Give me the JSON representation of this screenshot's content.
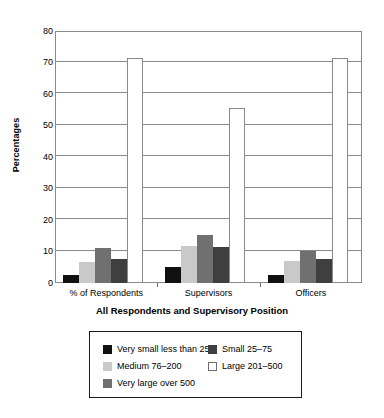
{
  "chart_data": {
    "type": "bar",
    "title": "",
    "xlabel": "All Respondents and Supervisory Position",
    "ylabel": "Percentages",
    "categories": [
      "% of Respondents",
      "Supervisors",
      "Officers"
    ],
    "ylim": [
      0,
      80
    ],
    "yticks": [
      0,
      10,
      20,
      30,
      40,
      50,
      60,
      70,
      80
    ],
    "ytick_labels": [
      "0",
      "10",
      "20",
      "30",
      "40",
      "50",
      "60",
      "70",
      "80"
    ],
    "grid": true,
    "legend_position": "bottom",
    "series": [
      {
        "name": "Very small less than 25",
        "color": "#111111",
        "values": [
          2.7,
          5.0,
          2.4
        ]
      },
      {
        "name": "Small 25–75",
        "color": "#3f3f3f",
        "values": [
          7.5,
          11.5,
          7.6
        ]
      },
      {
        "name": "Medium 76–200",
        "color": "#c9c9c9",
        "values": [
          6.8,
          11.7,
          7.0
        ]
      },
      {
        "name": "Large 201–500",
        "color": "#ffffff",
        "values": [
          71.5,
          55.5,
          71.5
        ]
      },
      {
        "name": "Very large over 500",
        "color": "#707070",
        "values": [
          11.0,
          15.3,
          10.2
        ]
      }
    ],
    "bar_order": [
      "Very small less than 25",
      "Medium 76–200",
      "Very large over 500",
      "Small 25–75",
      "Large 201–500"
    ]
  },
  "legend": {
    "items": [
      {
        "label": "Very small less than 25",
        "color": "#111111"
      },
      {
        "label": "Small 25–75",
        "color": "#3f3f3f"
      },
      {
        "label": "Medium 76–200",
        "color": "#c9c9c9"
      },
      {
        "label": "Large 201–500",
        "color": "#ffffff"
      },
      {
        "label": "Very large over 500",
        "color": "#707070"
      }
    ]
  }
}
